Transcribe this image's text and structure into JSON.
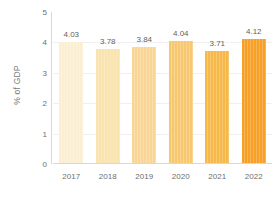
{
  "chart_data": {
    "type": "bar",
    "title": "",
    "subtitle": "",
    "xlabel": "",
    "ylabel": "% of GDP",
    "categories": [
      "2017",
      "2018",
      "2019",
      "2020",
      "2021",
      "2022"
    ],
    "values": [
      4.03,
      3.78,
      3.84,
      4.04,
      3.71,
      4.12
    ],
    "value_labels": [
      "4.03",
      "3.78",
      "3.84",
      "4.04",
      "3.71",
      "4.12"
    ],
    "ylim": [
      0,
      5
    ],
    "y_ticks": [
      "0",
      "1",
      "2",
      "3",
      "4",
      "5"
    ],
    "y_tick_values": [
      0,
      1,
      2,
      3,
      4,
      5
    ],
    "grid": true,
    "grid_axis": "y",
    "legend": false,
    "legend_position": "none",
    "bar_colors": [
      "#faefd2",
      "#f9e3ae",
      "#f9d697",
      "#f8c871",
      "#f7b84a",
      "#f6a028"
    ],
    "axis_color": "#d8d8d8",
    "gridline_color": "#f0f0f0",
    "label_color": "#6e6e6e",
    "value_label_color": "#5f5f5f",
    "background": "#ffffff"
  }
}
